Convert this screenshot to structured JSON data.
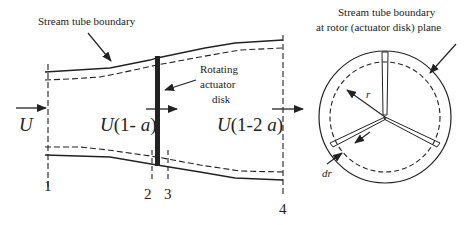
{
  "figure": {
    "labels": {
      "stream_tube_left": "Stream tube boundary",
      "rotating_disk_line1": "Rotating",
      "rotating_disk_line2": "actuator",
      "rotating_disk_line3": "disk",
      "stream_tube_right_line1": "Stream tube boundary",
      "stream_tube_right_line2": "at rotor (actuator disk) plane",
      "velocity_upstream": "U",
      "velocity_disk": "U(1- a)",
      "velocity_far_wake": "U(1-2 a)",
      "radius": "r",
      "radius_increment": "dr"
    },
    "stations": [
      {
        "id": "1",
        "label": "1"
      },
      {
        "id": "2",
        "label": "2"
      },
      {
        "id": "3",
        "label": "3"
      },
      {
        "id": "4",
        "label": "4"
      }
    ],
    "colors": {
      "line": "#222222",
      "background": "#ffffff"
    }
  }
}
